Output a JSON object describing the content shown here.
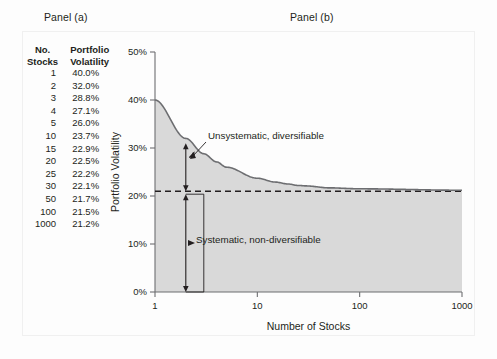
{
  "figure": {
    "panel_a_title": "Panel (a)",
    "panel_b_title": "Panel (b)"
  },
  "table": {
    "headers": {
      "stocks_line1": "No.",
      "stocks_line2": "Stocks",
      "vol_line1": "Portfolio",
      "vol_line2": "Volatility"
    },
    "rows": [
      {
        "stocks": "1",
        "volatility": "40.0%"
      },
      {
        "stocks": "2",
        "volatility": "32.0%"
      },
      {
        "stocks": "3",
        "volatility": "28.8%"
      },
      {
        "stocks": "4",
        "volatility": "27.1%"
      },
      {
        "stocks": "5",
        "volatility": "26.0%"
      },
      {
        "stocks": "10",
        "volatility": "23.7%"
      },
      {
        "stocks": "15",
        "volatility": "22.9%"
      },
      {
        "stocks": "20",
        "volatility": "22.5%"
      },
      {
        "stocks": "25",
        "volatility": "22.2%"
      },
      {
        "stocks": "30",
        "volatility": "22.1%"
      },
      {
        "stocks": "50",
        "volatility": "21.7%"
      },
      {
        "stocks": "100",
        "volatility": "21.5%"
      },
      {
        "stocks": "1000",
        "volatility": "21.2%"
      }
    ]
  },
  "chart_data": {
    "type": "line",
    "title": "Panel (b)",
    "xlabel": "Number of Stocks",
    "ylabel": "Portfolio Volatility",
    "xscale": "log",
    "xlim": [
      1,
      1000
    ],
    "ylim": [
      0,
      50
    ],
    "xticks": [
      1,
      10,
      100,
      1000
    ],
    "xticklabels": [
      "1",
      "10",
      "100",
      "1000"
    ],
    "yticks": [
      0,
      10,
      20,
      30,
      40,
      50
    ],
    "yticklabels": [
      "0%",
      "10%",
      "20%",
      "30%",
      "40%",
      "50%"
    ],
    "grid": false,
    "legend": null,
    "series": [
      {
        "name": "Portfolio Volatility",
        "x": [
          1,
          2,
          3,
          4,
          5,
          10,
          15,
          20,
          25,
          30,
          50,
          100,
          1000
        ],
        "values": [
          40.0,
          32.0,
          28.8,
          27.1,
          26.0,
          23.7,
          22.9,
          22.5,
          22.2,
          22.1,
          21.7,
          21.5,
          21.2
        ],
        "fill": true,
        "fill_color": "#d9d9d9",
        "line_color": "#6d6e71"
      }
    ],
    "reference_line": {
      "name": "Systematic risk level",
      "y": 21.0,
      "style": "dashed",
      "color": "#231f20"
    },
    "annotations": [
      {
        "name": "unsystematic",
        "text": "Unsystematic, diversifiable",
        "arrow_from_y": 31.0,
        "arrow_to_y": 21.0,
        "arrow_at_x": 2
      },
      {
        "name": "systematic",
        "text": "Systematic, non-diversifiable",
        "arrow_from_y": 21.0,
        "arrow_to_y": 0.0,
        "arrow_at_x": 2
      }
    ]
  }
}
